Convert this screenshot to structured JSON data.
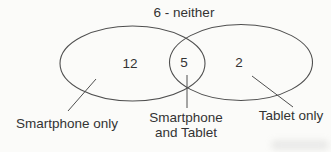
{
  "diagram": {
    "type": "venn",
    "top_label": "6 - neither",
    "regions": {
      "smartphone_only": "12",
      "smartphone_and_tablet": "5",
      "tablet_only": "2"
    },
    "callouts": {
      "left": "Smartphone only",
      "center_lines": [
        "Smartphone",
        "and Tablet"
      ],
      "right": "Tablet only"
    },
    "colors": {
      "stroke": "#4f4f4f",
      "text": "#333333",
      "background": "#fbfbf9"
    }
  }
}
